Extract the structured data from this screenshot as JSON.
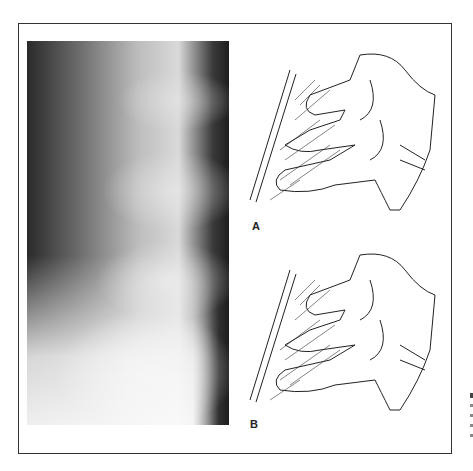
{
  "figure": {
    "panels": [
      {
        "id": "xray",
        "type": "radiograph",
        "description": "Lateral cervical spine radiograph"
      },
      {
        "id": "A",
        "label": "A",
        "type": "line-drawing",
        "description": "Cervical vertebrae illustration"
      },
      {
        "id": "B",
        "label": "B",
        "type": "line-drawing",
        "description": "Cervical vertebrae illustration"
      }
    ]
  }
}
